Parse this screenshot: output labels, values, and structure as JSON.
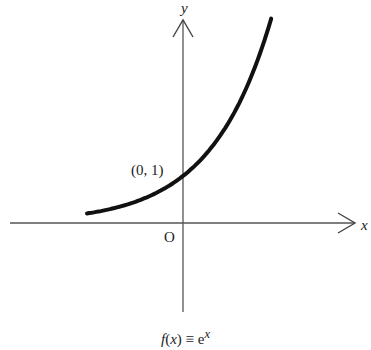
{
  "chart_data": {
    "type": "line",
    "caption": {
      "f": "f",
      "paren_open": "(",
      "x": "x",
      "paren_close": ")",
      "equiv": " ≡ e",
      "exp": "x"
    },
    "xlabel": "x",
    "ylabel": "y",
    "origin_label": "O",
    "annotations": [
      {
        "text": "(0, 1)",
        "x": 0,
        "y": 1
      }
    ],
    "series": [
      {
        "name": "e^x",
        "function": "exp",
        "x_range_estimated": [
          -1.6,
          1.47
        ],
        "x": [
          -1.6,
          -1.2,
          -0.8,
          -0.4,
          0,
          0.4,
          0.8,
          1.2,
          1.47
        ],
        "values": [
          0.2,
          0.3,
          0.449,
          0.67,
          1.0,
          1.492,
          2.226,
          3.32,
          4.35
        ]
      }
    ],
    "grid": false,
    "ticks": false,
    "color": "#111111"
  }
}
